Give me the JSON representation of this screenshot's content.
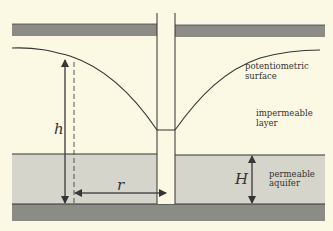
{
  "diagram": {
    "type": "confined aquifer well drawdown cross-section",
    "labels": {
      "surface_line1": "potentiometric",
      "surface_line2": "surface",
      "layer_line1": "impermeable",
      "layer_line2": "layer",
      "aquifer_line1": "permeable",
      "aquifer_line2": "aquifer",
      "h": "h",
      "r": "r",
      "H": "H"
    },
    "colors": {
      "background": "#fbf9e4",
      "confining_band": "#8c8c86",
      "aquifer": "#d6d5cb",
      "base": "#8c8c86",
      "line": "#333333"
    }
  }
}
